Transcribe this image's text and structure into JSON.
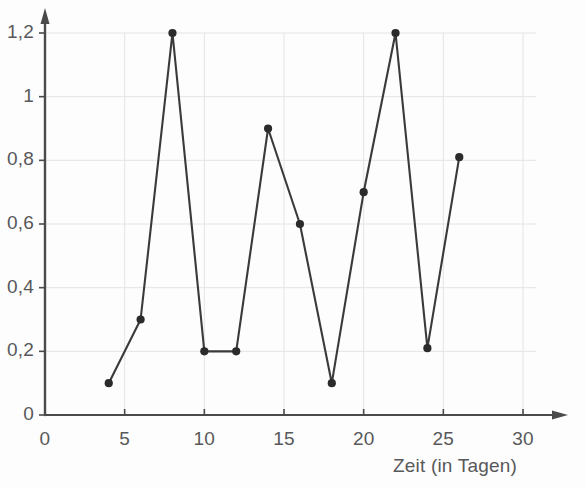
{
  "chart_data": {
    "type": "line",
    "title": "",
    "subtitle": "",
    "xlabel": "Zeit (in Tagen)",
    "ylabel": "",
    "xlim": [
      0,
      30
    ],
    "ylim": [
      0,
      1.2
    ],
    "grid": true,
    "legend": null,
    "x_ticks": [
      "0",
      "5",
      "10",
      "15",
      "20",
      "25",
      "30"
    ],
    "x_tick_values": [
      0,
      5,
      10,
      15,
      20,
      25,
      30
    ],
    "y_ticks": [
      "0",
      "0,2",
      "0,4",
      "0,6",
      "0,8",
      "1",
      "1,2"
    ],
    "y_tick_values": [
      0,
      0.2,
      0.4,
      0.6,
      0.8,
      1.0,
      1.2
    ],
    "x": [
      4,
      6,
      8,
      10,
      12,
      14,
      16,
      18,
      20,
      22,
      24,
      26
    ],
    "values": [
      0.1,
      0.3,
      1.2,
      0.2,
      0.2,
      0.9,
      0.6,
      0.1,
      0.7,
      1.2,
      0.21,
      0.81
    ],
    "series": [
      {
        "name": "",
        "x": [
          4,
          6,
          8,
          10,
          12,
          14,
          16,
          18,
          20,
          22,
          24,
          26
        ],
        "values": [
          0.1,
          0.3,
          1.2,
          0.2,
          0.2,
          0.9,
          0.6,
          0.1,
          0.7,
          1.2,
          0.21,
          0.81
        ],
        "marker": "circle",
        "line_color": "#3a3a3a",
        "marker_color": "#2b2b2b"
      }
    ],
    "colors": {
      "line": "#3a3a3a",
      "marker": "#2b2b2b",
      "axis": "#4a4a4a",
      "grid": "#e4e4e6",
      "text": "#58585a",
      "background": "#fdfdfd"
    }
  }
}
